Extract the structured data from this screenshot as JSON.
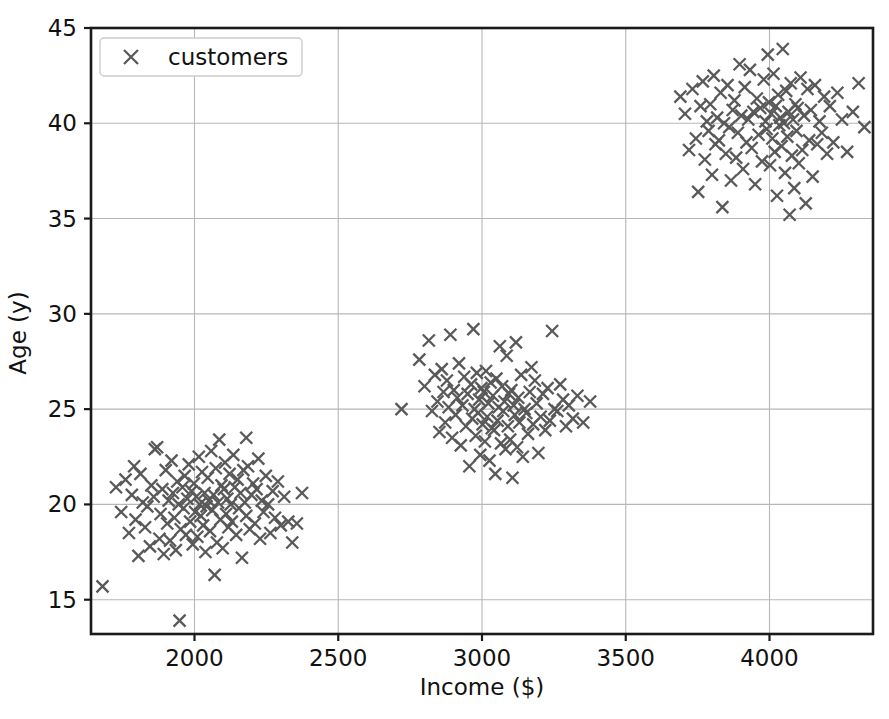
{
  "figure": {
    "background_color": "#ffffff",
    "width": 889,
    "height": 719
  },
  "legend": {
    "entries": [
      {
        "label": "customers",
        "marker": "x",
        "color": "#595959"
      }
    ],
    "position": "upper left",
    "frame": true
  },
  "axes": {
    "x_label": "Income ($)",
    "y_label": "Age (y)",
    "x_ticks": [
      "2000",
      "2500",
      "3000",
      "3500",
      "4000"
    ],
    "y_ticks": [
      "15",
      "20",
      "25",
      "30",
      "35",
      "40",
      "45"
    ],
    "grid": true,
    "grid_color": "#b7b7b7",
    "spine_color": "#1a1a1a"
  },
  "chart_data": {
    "type": "scatter",
    "title": "",
    "xlabel": "Income ($)",
    "ylabel": "Age (y)",
    "xlim": [
      1640,
      4360
    ],
    "ylim": [
      13.2,
      45
    ],
    "xticks": [
      2000,
      2500,
      3000,
      3500,
      4000
    ],
    "yticks": [
      15,
      20,
      25,
      30,
      35,
      40,
      45
    ],
    "grid": true,
    "legend_position": "upper left",
    "marker": "x",
    "marker_color": "#595959",
    "series": [
      {
        "name": "customers",
        "clusters": [
          {
            "name": "young-low-income",
            "center_x": 2050,
            "center_y": 19.8,
            "spread_x": 150,
            "spread_y": 1.9,
            "count": 110
          },
          {
            "name": "mid-age-mid-income",
            "center_x": 3020,
            "center_y": 25.0,
            "spread_x": 160,
            "spread_y": 1.8,
            "count": 110
          },
          {
            "name": "older-high-income",
            "center_x": 3990,
            "center_y": 39.9,
            "spread_x": 150,
            "spread_y": 1.8,
            "count": 120
          }
        ],
        "points": [
          [
            1680,
            15.7
          ],
          [
            1727,
            20.9
          ],
          [
            1745,
            19.6
          ],
          [
            1760,
            21.3
          ],
          [
            1772,
            18.5
          ],
          [
            1782,
            20.5
          ],
          [
            1790,
            22.0
          ],
          [
            1795,
            19.2
          ],
          [
            1805,
            17.3
          ],
          [
            1812,
            21.6
          ],
          [
            1820,
            20.1
          ],
          [
            1828,
            18.8
          ],
          [
            1836,
            19.9
          ],
          [
            1845,
            17.8
          ],
          [
            1850,
            21.0
          ],
          [
            1858,
            20.4
          ],
          [
            1862,
            22.9
          ],
          [
            1870,
            23.0
          ],
          [
            1878,
            18.2
          ],
          [
            1882,
            19.5
          ],
          [
            1888,
            20.8
          ],
          [
            1893,
            17.4
          ],
          [
            1900,
            21.8
          ],
          [
            1905,
            19.0
          ],
          [
            1910,
            20.2
          ],
          [
            1915,
            18.1
          ],
          [
            1920,
            22.3
          ],
          [
            1925,
            20.6
          ],
          [
            1930,
            19.3
          ],
          [
            1935,
            17.6
          ],
          [
            1940,
            21.2
          ],
          [
            1945,
            20.0
          ],
          [
            1948,
            13.9
          ],
          [
            1952,
            18.7
          ],
          [
            1958,
            20.9
          ],
          [
            1962,
            19.8
          ],
          [
            1966,
            21.5
          ],
          [
            1970,
            18.4
          ],
          [
            1975,
            20.3
          ],
          [
            1980,
            22.1
          ],
          [
            1985,
            19.1
          ],
          [
            1990,
            20.7
          ],
          [
            1994,
            17.9
          ],
          [
            1998,
            21.1
          ],
          [
            2002,
            19.6
          ],
          [
            2006,
            20.4
          ],
          [
            2010,
            18.3
          ],
          [
            2015,
            22.5
          ],
          [
            2018,
            20.0
          ],
          [
            2022,
            19.4
          ],
          [
            2026,
            21.7
          ],
          [
            2030,
            18.9
          ],
          [
            2035,
            20.6
          ],
          [
            2038,
            17.5
          ],
          [
            2042,
            19.9
          ],
          [
            2046,
            21.4
          ],
          [
            2050,
            20.2
          ],
          [
            2054,
            18.6
          ],
          [
            2058,
            22.8
          ],
          [
            2062,
            19.7
          ],
          [
            2066,
            20.5
          ],
          [
            2070,
            16.3
          ],
          [
            2074,
            21.9
          ],
          [
            2078,
            18.0
          ],
          [
            2082,
            20.1
          ],
          [
            2086,
            23.4
          ],
          [
            2090,
            19.2
          ],
          [
            2094,
            21.0
          ],
          [
            2098,
            17.7
          ],
          [
            2102,
            20.8
          ],
          [
            2106,
            22.2
          ],
          [
            2110,
            19.5
          ],
          [
            2114,
            20.3
          ],
          [
            2118,
            18.8
          ],
          [
            2122,
            21.6
          ],
          [
            2126,
            20.0
          ],
          [
            2130,
            19.1
          ],
          [
            2135,
            22.6
          ],
          [
            2140,
            20.9
          ],
          [
            2145,
            18.4
          ],
          [
            2150,
            21.3
          ],
          [
            2155,
            19.8
          ],
          [
            2160,
            20.6
          ],
          [
            2165,
            17.2
          ],
          [
            2170,
            21.8
          ],
          [
            2175,
            20.1
          ],
          [
            2180,
            19.4
          ],
          [
            2186,
            22.0
          ],
          [
            2192,
            18.7
          ],
          [
            2198,
            20.5
          ],
          [
            2204,
            21.1
          ],
          [
            2210,
            19.0
          ],
          [
            2216,
            20.8
          ],
          [
            2222,
            22.4
          ],
          [
            2228,
            18.2
          ],
          [
            2234,
            20.2
          ],
          [
            2240,
            19.6
          ],
          [
            2248,
            21.5
          ],
          [
            2256,
            20.0
          ],
          [
            2264,
            18.5
          ],
          [
            2272,
            20.7
          ],
          [
            2280,
            19.3
          ],
          [
            2290,
            21.2
          ],
          [
            2300,
            18.9
          ],
          [
            2312,
            20.4
          ],
          [
            2326,
            19.1
          ],
          [
            2340,
            18.0
          ],
          [
            2356,
            19.0
          ],
          [
            2374,
            20.6
          ],
          [
            2180,
            23.5
          ],
          [
            2720,
            25.0
          ],
          [
            2782,
            27.6
          ],
          [
            2800,
            26.2
          ],
          [
            2815,
            28.6
          ],
          [
            2826,
            24.9
          ],
          [
            2836,
            26.8
          ],
          [
            2845,
            25.4
          ],
          [
            2852,
            23.8
          ],
          [
            2860,
            27.1
          ],
          [
            2866,
            25.9
          ],
          [
            2872,
            24.3
          ],
          [
            2878,
            26.5
          ],
          [
            2884,
            25.1
          ],
          [
            2890,
            28.9
          ],
          [
            2896,
            23.5
          ],
          [
            2902,
            26.0
          ],
          [
            2908,
            24.7
          ],
          [
            2914,
            25.6
          ],
          [
            2920,
            27.4
          ],
          [
            2926,
            23.1
          ],
          [
            2932,
            25.2
          ],
          [
            2938,
            26.7
          ],
          [
            2944,
            24.1
          ],
          [
            2950,
            25.8
          ],
          [
            2956,
            22.0
          ],
          [
            2962,
            26.3
          ],
          [
            2966,
            24.5
          ],
          [
            2970,
            29.2
          ],
          [
            2974,
            25.0
          ],
          [
            2978,
            23.6
          ],
          [
            2982,
            26.9
          ],
          [
            2986,
            24.8
          ],
          [
            2990,
            25.5
          ],
          [
            2994,
            22.6
          ],
          [
            2998,
            26.1
          ],
          [
            3002,
            24.2
          ],
          [
            3006,
            25.9
          ],
          [
            3010,
            23.3
          ],
          [
            3014,
            27.0
          ],
          [
            3018,
            24.6
          ],
          [
            3022,
            25.3
          ],
          [
            3026,
            22.3
          ],
          [
            3030,
            26.4
          ],
          [
            3034,
            24.0
          ],
          [
            3038,
            25.7
          ],
          [
            3042,
            23.9
          ],
          [
            3046,
            21.6
          ],
          [
            3050,
            26.6
          ],
          [
            3054,
            24.4
          ],
          [
            3058,
            25.1
          ],
          [
            3062,
            28.3
          ],
          [
            3066,
            23.2
          ],
          [
            3070,
            26.2
          ],
          [
            3074,
            24.9
          ],
          [
            3078,
            25.4
          ],
          [
            3082,
            22.9
          ],
          [
            3086,
            27.8
          ],
          [
            3090,
            24.1
          ],
          [
            3094,
            25.8
          ],
          [
            3098,
            23.4
          ],
          [
            3102,
            26.0
          ],
          [
            3106,
            21.4
          ],
          [
            3110,
            25.2
          ],
          [
            3114,
            24.7
          ],
          [
            3118,
            28.5
          ],
          [
            3122,
            23.0
          ],
          [
            3126,
            25.6
          ],
          [
            3130,
            24.3
          ],
          [
            3136,
            26.8
          ],
          [
            3142,
            22.5
          ],
          [
            3148,
            25.0
          ],
          [
            3154,
            24.8
          ],
          [
            3160,
            23.7
          ],
          [
            3166,
            25.9
          ],
          [
            3172,
            27.2
          ],
          [
            3178,
            24.2
          ],
          [
            3184,
            26.5
          ],
          [
            3190,
            25.3
          ],
          [
            3196,
            22.7
          ],
          [
            3204,
            24.6
          ],
          [
            3212,
            25.8
          ],
          [
            3220,
            23.9
          ],
          [
            3228,
            26.1
          ],
          [
            3236,
            24.4
          ],
          [
            3244,
            29.1
          ],
          [
            3252,
            25.0
          ],
          [
            3262,
            24.9
          ],
          [
            3272,
            26.3
          ],
          [
            3282,
            25.5
          ],
          [
            3292,
            24.1
          ],
          [
            3302,
            25.2
          ],
          [
            3316,
            24.5
          ],
          [
            3332,
            25.7
          ],
          [
            3352,
            24.3
          ],
          [
            3376,
            25.4
          ],
          [
            3690,
            41.4
          ],
          [
            3706,
            40.5
          ],
          [
            3720,
            38.6
          ],
          [
            3732,
            41.8
          ],
          [
            3744,
            39.2
          ],
          [
            3752,
            36.4
          ],
          [
            3760,
            40.9
          ],
          [
            3768,
            42.2
          ],
          [
            3775,
            38.1
          ],
          [
            3782,
            40.1
          ],
          [
            3788,
            39.6
          ],
          [
            3794,
            41.0
          ],
          [
            3800,
            37.3
          ],
          [
            3806,
            42.5
          ],
          [
            3812,
            38.9
          ],
          [
            3818,
            40.3
          ],
          [
            3824,
            39.1
          ],
          [
            3830,
            41.6
          ],
          [
            3836,
            35.6
          ],
          [
            3842,
            40.0
          ],
          [
            3848,
            38.4
          ],
          [
            3854,
            42.0
          ],
          [
            3860,
            39.8
          ],
          [
            3866,
            37.0
          ],
          [
            3872,
            40.7
          ],
          [
            3878,
            41.2
          ],
          [
            3884,
            38.2
          ],
          [
            3890,
            39.5
          ],
          [
            3896,
            43.1
          ],
          [
            3902,
            40.4
          ],
          [
            3908,
            37.6
          ],
          [
            3914,
            41.9
          ],
          [
            3920,
            39.0
          ],
          [
            3926,
            40.2
          ],
          [
            3932,
            42.8
          ],
          [
            3938,
            38.7
          ],
          [
            3944,
            40.6
          ],
          [
            3950,
            36.8
          ],
          [
            3956,
            41.3
          ],
          [
            3962,
            39.4
          ],
          [
            3968,
            40.8
          ],
          [
            3974,
            38.0
          ],
          [
            3980,
            42.3
          ],
          [
            3986,
            40.1
          ],
          [
            3990,
            39.7
          ],
          [
            3994,
            43.6
          ],
          [
            3998,
            41.1
          ],
          [
            4002,
            37.8
          ],
          [
            4006,
            40.5
          ],
          [
            4010,
            39.2
          ],
          [
            4014,
            42.6
          ],
          [
            4018,
            38.5
          ],
          [
            4022,
            40.9
          ],
          [
            4026,
            36.2
          ],
          [
            4030,
            41.5
          ],
          [
            4034,
            39.9
          ],
          [
            4038,
            40.3
          ],
          [
            4042,
            38.8
          ],
          [
            4046,
            43.9
          ],
          [
            4050,
            40.0
          ],
          [
            4054,
            37.4
          ],
          [
            4058,
            41.7
          ],
          [
            4062,
            39.3
          ],
          [
            4066,
            40.6
          ],
          [
            4070,
            35.2
          ],
          [
            4074,
            42.1
          ],
          [
            4078,
            38.3
          ],
          [
            4082,
            40.2
          ],
          [
            4086,
            36.6
          ],
          [
            4090,
            41.0
          ],
          [
            4094,
            39.6
          ],
          [
            4098,
            40.8
          ],
          [
            4102,
            37.9
          ],
          [
            4108,
            42.4
          ],
          [
            4114,
            38.6
          ],
          [
            4120,
            40.4
          ],
          [
            4126,
            35.8
          ],
          [
            4132,
            41.8
          ],
          [
            4138,
            39.1
          ],
          [
            4144,
            40.7
          ],
          [
            4150,
            37.2
          ],
          [
            4158,
            42.0
          ],
          [
            4166,
            38.9
          ],
          [
            4174,
            40.1
          ],
          [
            4182,
            39.5
          ],
          [
            4190,
            41.4
          ],
          [
            4200,
            38.4
          ],
          [
            4210,
            40.9
          ],
          [
            4222,
            39.0
          ],
          [
            4236,
            41.6
          ],
          [
            4252,
            40.2
          ],
          [
            4270,
            38.5
          ],
          [
            4290,
            40.6
          ],
          [
            4310,
            42.1
          ],
          [
            4330,
            39.8
          ]
        ]
      }
    ]
  }
}
